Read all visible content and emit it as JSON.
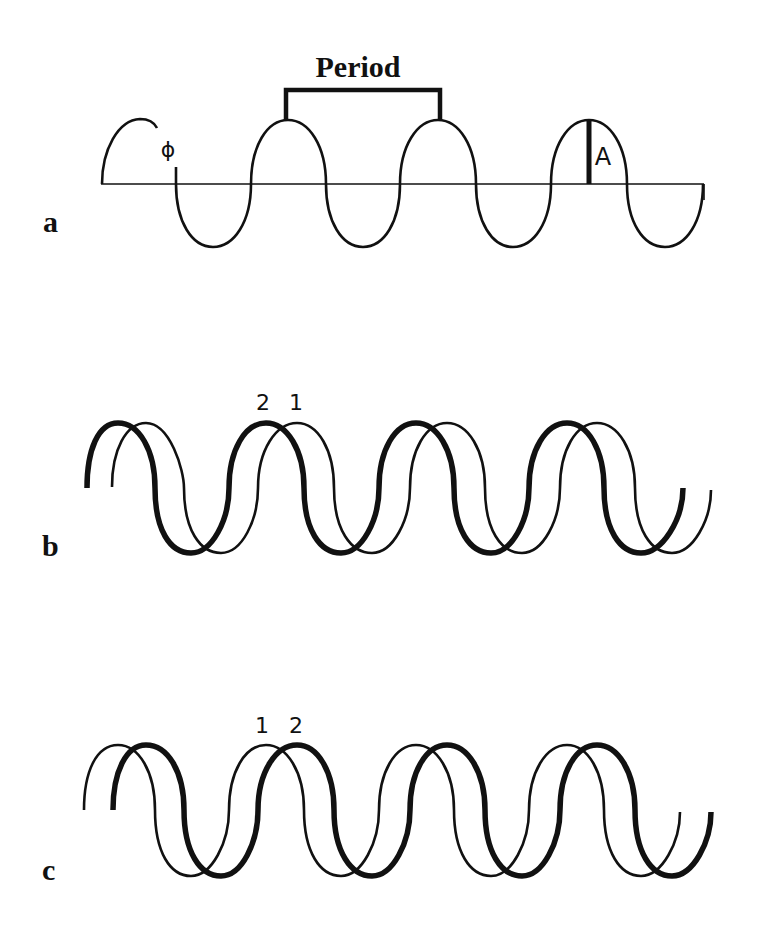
{
  "figure": {
    "panels": [
      {
        "id": "a",
        "label": "a",
        "annotations": {
          "period_label": "Period",
          "phase_label": "ϕ",
          "amplitude_label": "A"
        }
      },
      {
        "id": "b",
        "label": "b",
        "annotations": {
          "wave_labels": [
            "2",
            "1"
          ]
        },
        "description": "Wave 2 (thick) leads wave 1 (thin)"
      },
      {
        "id": "c",
        "label": "c",
        "annotations": {
          "wave_labels": [
            "1",
            "2"
          ]
        },
        "description": "Wave 1 (thin) leads wave 2 (thick)"
      }
    ]
  },
  "colors": {
    "ink": "#111111",
    "background": "#ffffff"
  }
}
